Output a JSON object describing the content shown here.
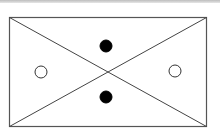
{
  "diagram": {
    "colors": {
      "stroke": "#444444",
      "filled": "#000000",
      "hollow_fill": "#ffffff",
      "topbar": "#c8c8c8"
    },
    "rect": {
      "x": 9,
      "y": 17,
      "w": 197,
      "h": 109
    },
    "circles": [
      {
        "name": "top",
        "cx": 106,
        "cy": 46,
        "r": 6,
        "filled": true
      },
      {
        "name": "bottom",
        "cx": 106,
        "cy": 97,
        "r": 6,
        "filled": true
      },
      {
        "name": "left",
        "cx": 41,
        "cy": 72,
        "r": 6,
        "filled": false
      },
      {
        "name": "right",
        "cx": 175,
        "cy": 71,
        "r": 6,
        "filled": false
      }
    ]
  }
}
